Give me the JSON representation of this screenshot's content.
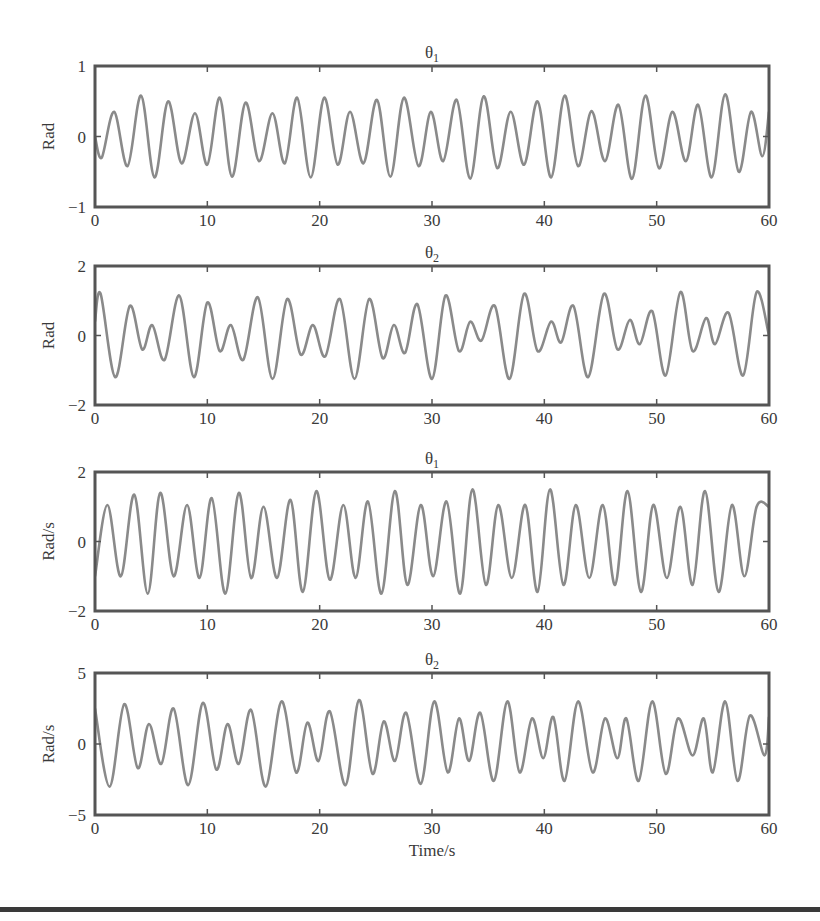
{
  "chart_data": [
    {
      "type": "line",
      "title": "θ1",
      "title_base": "θ",
      "title_sub": "1",
      "xlabel": "",
      "ylabel": "Rad",
      "xlim": [
        0,
        60
      ],
      "ylim": [
        -1,
        1
      ],
      "xticks": [
        0,
        10,
        20,
        30,
        40,
        50,
        60
      ],
      "yticks": [
        -1,
        0,
        1
      ],
      "ytick_labels": [
        "−1",
        "0",
        "1"
      ],
      "grid": false,
      "box": {
        "top": 66,
        "bottom": 207
      },
      "series": [
        {
          "name": "θ1",
          "x": [
            0,
            0.6,
            1.7,
            2.9,
            4.1,
            5.3,
            6.5,
            7.7,
            8.9,
            10.0,
            11.1,
            12.2,
            13.4,
            14.6,
            15.8,
            16.9,
            18.0,
            19.2,
            20.4,
            21.6,
            22.7,
            23.9,
            25.1,
            26.3,
            27.5,
            28.8,
            29.9,
            31.0,
            32.2,
            33.4,
            34.6,
            35.8,
            37.0,
            38.2,
            39.4,
            40.6,
            41.8,
            43.0,
            44.2,
            45.4,
            46.6,
            47.8,
            49.0,
            50.2,
            51.4,
            52.6,
            53.7,
            54.9,
            56.1,
            57.3,
            58.4,
            59.4,
            60
          ],
          "y": [
            0,
            -0.3,
            0.35,
            -0.42,
            0.58,
            -0.58,
            0.5,
            -0.38,
            0.33,
            -0.4,
            0.55,
            -0.57,
            0.48,
            -0.35,
            0.33,
            -0.38,
            0.55,
            -0.58,
            0.55,
            -0.4,
            0.35,
            -0.38,
            0.52,
            -0.57,
            0.55,
            -0.42,
            0.35,
            -0.35,
            0.52,
            -0.6,
            0.57,
            -0.45,
            0.35,
            -0.4,
            0.5,
            -0.58,
            0.58,
            -0.42,
            0.36,
            -0.35,
            0.45,
            -0.6,
            0.58,
            -0.45,
            0.35,
            -0.35,
            0.45,
            -0.58,
            0.6,
            -0.5,
            0.35,
            -0.28,
            0.35
          ]
        }
      ]
    },
    {
      "type": "line",
      "title": "θ2",
      "title_base": "θ",
      "title_sub": "2",
      "xlabel": "",
      "ylabel": "Rad",
      "xlim": [
        0,
        60
      ],
      "ylim": [
        -2,
        2
      ],
      "xticks": [
        0,
        10,
        20,
        30,
        40,
        50,
        60
      ],
      "yticks": [
        -2,
        0,
        2
      ],
      "ytick_labels": [
        "−2",
        "0",
        "2"
      ],
      "grid": false,
      "box": {
        "top": 266,
        "bottom": 405
      },
      "series": [
        {
          "name": "θ2",
          "x": [
            0,
            0.5,
            1.8,
            3.1,
            4.2,
            5.1,
            6.2,
            7.5,
            8.8,
            10.0,
            11.1,
            12.1,
            13.2,
            14.5,
            15.8,
            17.1,
            18.3,
            19.4,
            20.5,
            21.8,
            23.1,
            24.4,
            25.6,
            26.6,
            27.6,
            28.7,
            30.0,
            31.2,
            32.4,
            33.4,
            34.4,
            35.6,
            36.9,
            38.2,
            39.4,
            40.6,
            41.5,
            42.6,
            43.9,
            45.3,
            46.5,
            47.6,
            48.5,
            49.6,
            50.8,
            52.1,
            53.2,
            54.4,
            55.2,
            56.4,
            57.7,
            58.9,
            60
          ],
          "y": [
            0.4,
            1.2,
            -1.2,
            0.85,
            -0.4,
            0.3,
            -0.7,
            1.15,
            -1.2,
            0.95,
            -0.45,
            0.3,
            -0.7,
            1.1,
            -1.25,
            1.05,
            -0.55,
            0.3,
            -0.6,
            1.05,
            -1.25,
            1.05,
            -0.65,
            0.3,
            -0.5,
            0.9,
            -1.25,
            1.15,
            -0.45,
            0.4,
            -0.15,
            0.85,
            -1.25,
            1.2,
            -0.45,
            0.4,
            -0.2,
            0.85,
            -1.2,
            1.2,
            -0.4,
            0.45,
            -0.25,
            0.7,
            -1.15,
            1.25,
            -0.45,
            0.5,
            -0.25,
            0.65,
            -1.15,
            1.25,
            0
          ]
        }
      ]
    },
    {
      "type": "line",
      "title": "θ1",
      "title_base": "θ",
      "title_sub": "1",
      "xlabel": "",
      "ylabel": "Rad/s",
      "xlim": [
        0,
        60
      ],
      "ylim": [
        -2,
        2
      ],
      "xticks": [
        0,
        10,
        20,
        30,
        40,
        50,
        60
      ],
      "yticks": [
        -2,
        0,
        2
      ],
      "ytick_labels": [
        "−2",
        "0",
        "2"
      ],
      "grid": false,
      "box": {
        "top": 472,
        "bottom": 611
      },
      "series": [
        {
          "name": "θ1 rate",
          "x": [
            0,
            1.1,
            2.3,
            3.5,
            4.7,
            5.8,
            7.0,
            8.2,
            9.3,
            10.4,
            11.6,
            12.8,
            13.9,
            15.0,
            16.2,
            17.4,
            18.5,
            19.7,
            20.9,
            22.1,
            23.2,
            24.3,
            25.5,
            26.7,
            27.8,
            29.0,
            30.1,
            31.3,
            32.5,
            33.6,
            34.8,
            35.9,
            37.1,
            38.3,
            39.4,
            40.5,
            41.7,
            42.8,
            44.0,
            45.2,
            46.3,
            47.4,
            48.6,
            49.7,
            50.9,
            52.1,
            53.2,
            54.3,
            55.5,
            56.7,
            57.8,
            58.9,
            60
          ],
          "y": [
            -1,
            1.05,
            -1.0,
            1.35,
            -1.5,
            1.4,
            -1.0,
            1.05,
            -1.05,
            1.25,
            -1.5,
            1.4,
            -1.05,
            1.0,
            -1.05,
            1.2,
            -1.45,
            1.45,
            -1.1,
            1.05,
            -1.05,
            1.15,
            -1.5,
            1.45,
            -1.25,
            1.05,
            -1.0,
            1.15,
            -1.5,
            1.5,
            -1.25,
            1.05,
            -1.05,
            1.05,
            -1.45,
            1.5,
            -1.25,
            1.05,
            -1.05,
            1.05,
            -1.25,
            1.45,
            -1.45,
            1.05,
            -1.05,
            1.0,
            -1.25,
            1.45,
            -1.45,
            1.05,
            -1.0,
            1.0,
            1.0
          ]
        }
      ]
    },
    {
      "type": "line",
      "title": "θ2",
      "title_base": "θ",
      "title_sub": "2",
      "xlabel": "Time/s",
      "ylabel": "Rad/s",
      "xlim": [
        0,
        60
      ],
      "ylim": [
        -5,
        5
      ],
      "xticks": [
        0,
        10,
        20,
        30,
        40,
        50,
        60
      ],
      "yticks": [
        -5,
        0,
        5
      ],
      "ytick_labels": [
        "−5",
        "0",
        "5"
      ],
      "grid": false,
      "box": {
        "top": 673,
        "bottom": 815
      },
      "series": [
        {
          "name": "θ2 rate",
          "x": [
            0,
            1.3,
            2.6,
            3.8,
            4.8,
            5.9,
            7.0,
            8.3,
            9.6,
            10.8,
            11.8,
            12.8,
            13.9,
            15.2,
            16.6,
            17.9,
            18.9,
            19.9,
            20.9,
            22.3,
            23.5,
            24.7,
            25.7,
            26.7,
            27.7,
            29.0,
            30.2,
            31.4,
            32.4,
            33.3,
            34.3,
            35.5,
            36.7,
            37.8,
            38.9,
            39.9,
            40.8,
            41.8,
            43.0,
            44.3,
            45.4,
            46.5,
            47.3,
            48.4,
            49.6,
            50.8,
            51.9,
            53.2,
            54.2,
            55.0,
            56.1,
            57.2,
            58.3,
            59.6,
            60
          ],
          "y": [
            2.5,
            -3.0,
            2.8,
            -1.7,
            1.4,
            -1.4,
            2.5,
            -2.9,
            2.9,
            -1.8,
            1.4,
            -1.4,
            2.4,
            -3.0,
            3.0,
            -2.0,
            1.5,
            -1.2,
            2.3,
            -2.9,
            3.1,
            -2.1,
            1.6,
            -1.2,
            2.2,
            -2.8,
            3.0,
            -2.0,
            1.8,
            -1.2,
            2.2,
            -2.6,
            3.0,
            -2.0,
            1.8,
            -1.0,
            1.9,
            -2.6,
            3.0,
            -2.0,
            1.8,
            -1.0,
            1.8,
            -2.6,
            3.0,
            -2.1,
            1.8,
            -0.8,
            1.8,
            -2.0,
            3.0,
            -2.6,
            2.0,
            -0.8,
            1.9,
            -2.5
          ]
        }
      ]
    }
  ],
  "figure": {
    "axes_left": 95,
    "axes_right": 769,
    "line_color": "#8a8a8a",
    "axes_color": "#555555",
    "text_color": "#3a3a3a",
    "xlabel": "Time/s"
  }
}
